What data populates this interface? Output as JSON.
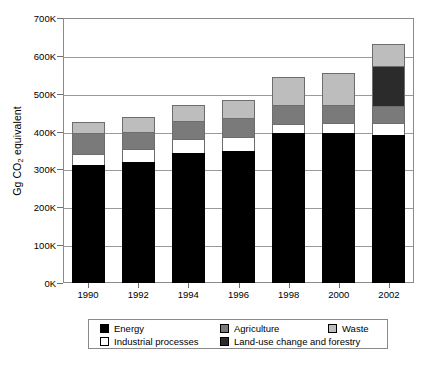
{
  "chart_data": {
    "type": "bar",
    "subtype": "stacked",
    "title": "",
    "xlabel": "",
    "ylabel": "Gg CO2 equivalent",
    "ylabel_parts": {
      "prefix": "Gg CO",
      "sub": "2",
      "suffix": " equivalent"
    },
    "categories": [
      "1990",
      "1992",
      "1994",
      "1996",
      "1998",
      "2000",
      "2002"
    ],
    "ylim": [
      0,
      700000
    ],
    "ytick_labels": [
      "0K",
      "100K",
      "200K",
      "300K",
      "400K",
      "500K",
      "600K",
      "700K"
    ],
    "ytick_values": [
      0,
      100000,
      200000,
      300000,
      400000,
      500000,
      600000,
      700000
    ],
    "units": "Gg CO2 equivalent (thousands, K)",
    "grid": true,
    "legend_position": "below",
    "stack_order": [
      "Energy",
      "Industrial processes",
      "Agriculture",
      "Land-use change and forestry",
      "Waste"
    ],
    "series": [
      {
        "name": "Energy",
        "color": "#000000",
        "values": [
          312000,
          320000,
          343000,
          350000,
          395000,
          397000,
          390000
        ]
      },
      {
        "name": "Industrial processes",
        "color": "#ffffff",
        "values": [
          28000,
          35000,
          37000,
          35000,
          25000,
          25000,
          32000
        ]
      },
      {
        "name": "Agriculture",
        "color": "#7a7a7a",
        "values": [
          55000,
          45000,
          48000,
          50000,
          50000,
          48000,
          45000
        ]
      },
      {
        "name": "Land-use change and forestry",
        "color": "#2b2b2b",
        "values": [
          0,
          0,
          0,
          0,
          0,
          0,
          105000
        ]
      },
      {
        "name": "Waste",
        "color": "#bdbdbd",
        "values": [
          30000,
          38000,
          42000,
          48000,
          73000,
          85000,
          60000
        ]
      }
    ],
    "totals": [
      425000,
      438000,
      470000,
      483000,
      543000,
      555000,
      632000
    ]
  },
  "legend": {
    "row1": [
      {
        "label": "Energy",
        "color": "#000000",
        "name": "energy"
      },
      {
        "label": "Agriculture",
        "color": "#7a7a7a",
        "name": "agriculture"
      },
      {
        "label": "Waste",
        "color": "#bdbdbd",
        "name": "waste"
      }
    ],
    "row2": [
      {
        "label": "Industrial processes",
        "color": "#ffffff",
        "name": "industrial-processes"
      },
      {
        "label": "Land-use change and forestry",
        "color": "#2b2b2b",
        "name": "land-use-change-and-forestry"
      }
    ]
  },
  "caption": ""
}
